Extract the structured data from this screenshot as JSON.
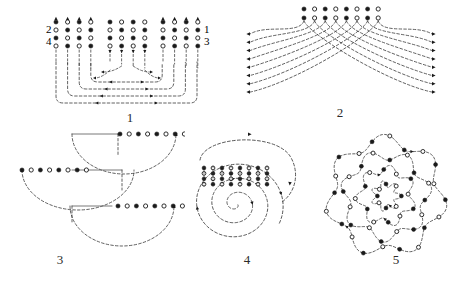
{
  "sheet": {
    "background": "#ffffff",
    "ink": "#1a1a1a",
    "dash_color": "#3a3a3a",
    "width": 455,
    "height": 289
  },
  "figures": [
    {
      "id": "fig1",
      "number": "1",
      "caption_number": "1",
      "kind": "parallel-routing-network",
      "description": "Two rows of node columns with nested U-shaped dashed feedback arrows",
      "side_labels": {
        "top_left": "2",
        "bottom_left": "4",
        "top_right": "1",
        "bottom_right": "3"
      },
      "columns": 12,
      "rows_per_column": 4,
      "node_fill_pattern": [
        "filled",
        "open",
        "filled",
        "open"
      ],
      "arrow_style": "dashed",
      "loop_count": 4
    },
    {
      "id": "fig2",
      "number": "2",
      "caption_number": "2",
      "kind": "fan-out-crossbar",
      "description": "Eight alternating nodes fanning into crossing dashed arcs terminating in left and right arrowheads",
      "node_count": 8,
      "node_rows": 2,
      "node_fill_pattern": [
        "filled",
        "open",
        "filled",
        "open",
        "filled",
        "open",
        "filled",
        "open"
      ],
      "left_arrows": 8,
      "right_arrows": 8,
      "arrow_style": "dashed"
    },
    {
      "id": "fig3",
      "number": "3",
      "caption_number": "3",
      "kind": "stacked-semicircle-feedback",
      "description": "Three horizontal node rows joined by large dashed semicircular return arcs",
      "rows": 3,
      "nodes_per_row": 8,
      "node_fill_pattern": [
        "filled",
        "open",
        "filled",
        "open",
        "filled",
        "open",
        "filled",
        "open"
      ],
      "arc_count": 3,
      "arrow_style": "dashed"
    },
    {
      "id": "fig4",
      "number": "4",
      "caption_number": "4",
      "kind": "spiral-routing",
      "description": "Archimedean dashed spiral with a row of eight vertical node pairs across the upper region",
      "node_columns": 8,
      "nodes_per_column": 4,
      "node_fill_pattern": [
        "filled",
        "open",
        "filled",
        "open"
      ],
      "spiral_turns": 3,
      "arrow_style": "dashed"
    },
    {
      "id": "fig5",
      "number": "5",
      "caption_number": "5",
      "kind": "rosette-spiral",
      "description": "Nested rounded-polygon rosette loops studded with alternating filled and open nodes",
      "loops": 4,
      "lobes": 7,
      "node_fill_pattern": [
        "filled",
        "open"
      ],
      "arrow_style": "dashed"
    }
  ]
}
